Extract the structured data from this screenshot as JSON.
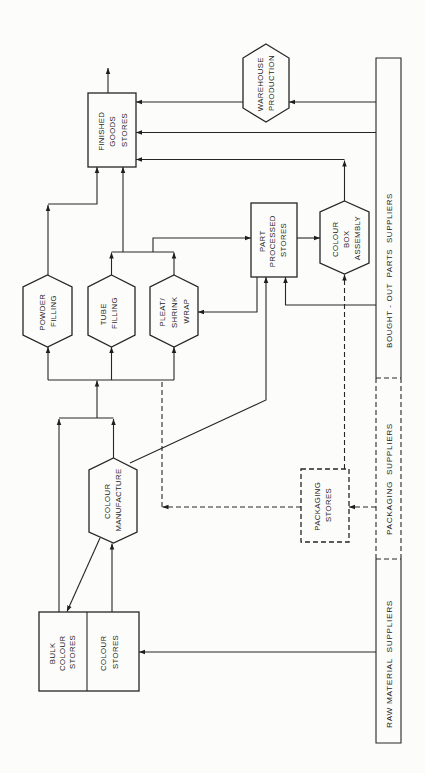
{
  "diagram": {
    "orientation": "rotated 90 degrees counter-clockwise",
    "nodes": {
      "finished_goods_stores": {
        "shape": "rectangle",
        "lines": [
          "FINISHED",
          "GOODS",
          "STORES"
        ]
      },
      "warehouse_production": {
        "shape": "hexagon",
        "lines": [
          "WAREHOUSE",
          "PRODUCTION"
        ]
      },
      "powder_filling": {
        "shape": "hexagon",
        "lines": [
          "POWDER",
          "FILLING"
        ]
      },
      "tube_filling": {
        "shape": "hexagon",
        "lines": [
          "TUBE",
          "FILLING"
        ]
      },
      "pleat_shrink_wrap": {
        "shape": "hexagon",
        "lines": [
          "PLEAT/",
          "SHRINK",
          "WRAP"
        ]
      },
      "part_processed_stores": {
        "shape": "rectangle",
        "lines": [
          "PART",
          "PROCESSED",
          "STORES"
        ]
      },
      "colour_box_assembly": {
        "shape": "hexagon",
        "lines": [
          "COLOUR",
          "BOX",
          "ASSEMBLY"
        ]
      },
      "colour_manufacture": {
        "shape": "hexagon",
        "lines": [
          "COLOUR",
          "MANUFACTURE"
        ]
      },
      "packaging_stores": {
        "shape": "rectangle",
        "border": "dashed",
        "lines": [
          "PACKAGING",
          "STORES"
        ]
      },
      "bulk_colour_stores": {
        "shape": "rectangle",
        "lines": [
          "BULK",
          "COLOUR",
          "STORES"
        ]
      },
      "colour_stores": {
        "shape": "rectangle",
        "lines": [
          "COLOUR",
          "STORES"
        ]
      }
    },
    "suppliers": {
      "bought_out": {
        "label": "BOUGHT - OUT  PARTS  SUPPLIERS",
        "border": "solid"
      },
      "packaging": {
        "label": "PACKAGING  SUPPLIERS",
        "border": "dashed"
      },
      "raw_material": {
        "label": "RAW MATERIAL  SUPPLIERS",
        "border": "solid"
      }
    },
    "edges": [
      {
        "from": "raw_material",
        "to": "colour_stores",
        "style": "solid"
      },
      {
        "from": "colour_stores",
        "to": "colour_manufacture",
        "style": "solid"
      },
      {
        "from": "colour_manufacture",
        "to": "bulk_colour_stores",
        "style": "solid"
      },
      {
        "from": "bulk_colour_stores",
        "to": "powder_filling / tube_filling / pleat_shrink_wrap",
        "style": "solid"
      },
      {
        "from": "colour_manufacture",
        "to": "powder_filling / tube_filling / pleat_shrink_wrap",
        "style": "solid"
      },
      {
        "from": "colour_manufacture",
        "to": "part_processed_stores",
        "style": "solid"
      },
      {
        "from": "packaging",
        "to": "packaging_stores",
        "style": "dashed"
      },
      {
        "from": "packaging_stores",
        "to": "powder_filling / tube_filling / pleat_shrink_wrap",
        "style": "dashed"
      },
      {
        "from": "packaging_stores",
        "to": "colour_box_assembly",
        "style": "dashed"
      },
      {
        "from": "bought_out",
        "to": "part_processed_stores",
        "style": "solid"
      },
      {
        "from": "bought_out",
        "to": "warehouse_production",
        "style": "solid"
      },
      {
        "from": "bought_out",
        "to": "finished_goods_stores",
        "style": "solid"
      },
      {
        "from": "part_processed_stores",
        "to": "pleat_shrink_wrap",
        "style": "solid"
      },
      {
        "from": "tube_filling / pleat_shrink_wrap",
        "to": "part_processed_stores",
        "style": "solid"
      },
      {
        "from": "tube_filling / pleat_shrink_wrap",
        "to": "finished_goods_stores",
        "style": "solid"
      },
      {
        "from": "powder_filling",
        "to": "finished_goods_stores",
        "style": "solid"
      },
      {
        "from": "part_processed_stores",
        "to": "colour_box_assembly",
        "style": "solid"
      },
      {
        "from": "colour_box_assembly",
        "to": "finished_goods_stores",
        "style": "solid"
      },
      {
        "from": "warehouse_production",
        "to": "finished_goods_stores",
        "style": "solid"
      },
      {
        "from": "finished_goods_stores",
        "to": "output",
        "style": "solid"
      }
    ]
  }
}
